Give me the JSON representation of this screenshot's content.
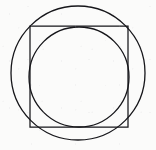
{
  "figure": {
    "title": "Circle, square and inscribed circle",
    "background_color": "#fbfbfa",
    "stroke_color": "#16161a",
    "canvas": {
      "width": 156,
      "height": 150
    },
    "shapes": [
      {
        "id": "outer-circle",
        "type": "circle",
        "label": "Outer circle circumscribing the square",
        "cx": 78,
        "cy": 73,
        "r": 67,
        "stroke_width": 1.3
      },
      {
        "id": "square",
        "type": "rect",
        "label": "Square inscribed in the outer circle",
        "x": 30,
        "y": 26,
        "width": 98,
        "height": 101,
        "stroke_width": 1.25
      },
      {
        "id": "inner-circle",
        "type": "circle",
        "label": "Inner circle inscribed in the square",
        "cx": 79,
        "cy": 77,
        "r": 50,
        "stroke_width": 1.3
      }
    ]
  }
}
